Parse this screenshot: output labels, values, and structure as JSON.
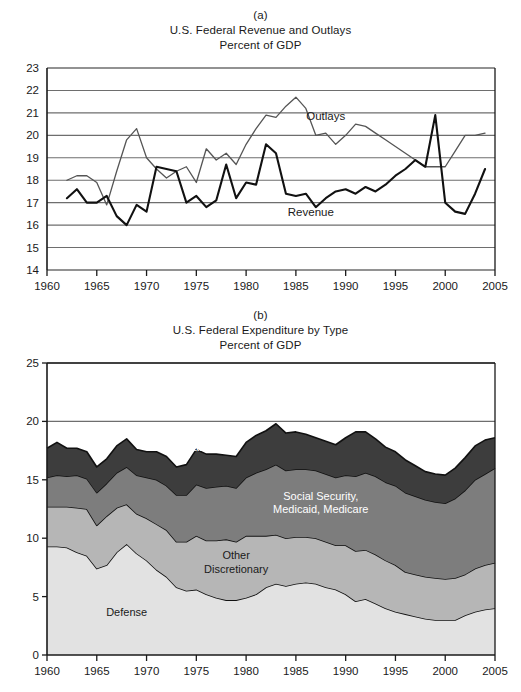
{
  "figure": {
    "panels": [
      {
        "letter": "(a)",
        "title": "U.S. Federal Revenue and Outlays",
        "subtitle": "Percent of GDP"
      },
      {
        "letter": "(b)",
        "title": "U.S. Federal Expenditure by Type",
        "subtitle": "Percent of GDP"
      }
    ]
  },
  "chart_data": [
    {
      "type": "line",
      "title": "U.S. Federal Revenue and Outlays",
      "subtitle": "Percent of GDP",
      "panel": "(a)",
      "xlabel": "",
      "ylabel": "Percent of GDP",
      "xlim": [
        1960,
        2005
      ],
      "ylim": [
        14,
        23
      ],
      "xticks": [
        1960,
        1965,
        1970,
        1975,
        1980,
        1985,
        1990,
        1995,
        2000,
        2005
      ],
      "yticks": [
        14,
        15,
        16,
        17,
        18,
        19,
        20,
        21,
        22,
        23
      ],
      "grid": "horizontal",
      "legend": "inline-annotations",
      "annotations": [
        {
          "text": "Outlays",
          "x": 1988.0,
          "y": 20.85
        },
        {
          "text": "Revenue",
          "x": 1986.5,
          "y": 16.6
        }
      ],
      "x": [
        1962,
        1963,
        1964,
        1965,
        1966,
        1967,
        1968,
        1969,
        1970,
        1971,
        1972,
        1973,
        1974,
        1975,
        1976,
        1977,
        1978,
        1979,
        1980,
        1981,
        1982,
        1983,
        1984,
        1985,
        1986,
        1987,
        1988,
        1989,
        1990,
        1991,
        1992,
        1993,
        1994,
        1995,
        1996,
        1997,
        1998,
        1999,
        2000,
        2001,
        2002,
        2003,
        2004
      ],
      "series": [
        {
          "name": "Revenue",
          "style": "thick-black",
          "values": [
            17.2,
            17.6,
            17.0,
            17.0,
            17.3,
            16.4,
            16.0,
            16.9,
            16.6,
            18.6,
            18.5,
            18.4,
            17.0,
            17.3,
            16.8,
            17.1,
            18.7,
            17.2,
            17.9,
            17.8,
            19.6,
            19.2,
            17.4,
            17.3,
            17.4,
            16.8,
            17.2,
            17.5,
            17.6,
            17.4,
            17.7,
            17.5,
            17.8,
            18.2,
            18.5,
            18.9,
            18.6,
            20.9,
            17.0,
            16.6,
            16.5,
            17.4,
            18.5
          ]
        },
        {
          "name": "Outlays",
          "style": "thin-gray",
          "values": [
            18.0,
            18.2,
            18.2,
            17.9,
            16.9,
            18.4,
            19.8,
            20.3,
            19.0,
            18.5,
            18.1,
            18.4,
            18.6,
            17.9,
            19.4,
            18.9,
            19.2,
            18.7,
            19.6,
            20.3,
            20.9,
            20.8,
            21.3,
            21.7,
            21.2,
            20.0,
            20.1,
            19.6,
            20.0,
            20.5,
            20.4,
            20.1,
            19.8,
            19.5,
            19.2,
            18.9,
            18.6,
            18.6,
            18.6,
            19.3,
            20.0,
            20.0,
            20.1,
            20.4
          ]
        }
      ]
    },
    {
      "type": "area",
      "stacked": true,
      "title": "U.S. Federal Expenditure by Type",
      "subtitle": "Percent of GDP",
      "panel": "(b)",
      "xlabel": "",
      "ylabel": "Percent of GDP",
      "xlim": [
        1960,
        2005
      ],
      "ylim": [
        0,
        25
      ],
      "xticks": [
        1960,
        1965,
        1970,
        1975,
        1980,
        1985,
        1990,
        1995,
        2000,
        2005
      ],
      "yticks": [
        0,
        5,
        10,
        15,
        20,
        25
      ],
      "grid": "horizontal",
      "legend": "inline-area-labels",
      "annotations": [
        {
          "text": "Other Mandatory",
          "x": 1974.5,
          "y": 18.6,
          "color": "#ffffff"
        },
        {
          "text": "Social Security, Medicaid, Medicare",
          "x": 1987.5,
          "y": 13.3,
          "color": "#ffffff"
        },
        {
          "text": "Other Discretionary",
          "x": 1979.0,
          "y": 8.2,
          "color": "#1a1a1a"
        },
        {
          "text": "Defense",
          "x": 1968.0,
          "y": 3.3,
          "color": "#1a1a1a"
        }
      ],
      "x": [
        1960,
        1961,
        1962,
        1963,
        1964,
        1965,
        1966,
        1967,
        1968,
        1969,
        1970,
        1971,
        1972,
        1973,
        1974,
        1975,
        1976,
        1977,
        1978,
        1979,
        1980,
        1981,
        1982,
        1983,
        1984,
        1985,
        1986,
        1987,
        1988,
        1989,
        1990,
        1991,
        1992,
        1993,
        1994,
        1995,
        1996,
        1997,
        1998,
        1999,
        2000,
        2001,
        2002,
        2003,
        2004,
        2005
      ],
      "series": [
        {
          "name": "Defense",
          "color": "#e2e2e2",
          "values": [
            9.3,
            9.3,
            9.2,
            8.8,
            8.5,
            7.4,
            7.7,
            8.8,
            9.5,
            8.7,
            8.1,
            7.3,
            6.7,
            5.8,
            5.5,
            5.6,
            5.2,
            4.9,
            4.7,
            4.7,
            4.9,
            5.2,
            5.8,
            6.1,
            5.9,
            6.1,
            6.2,
            6.1,
            5.8,
            5.6,
            5.2,
            4.6,
            4.8,
            4.4,
            4.0,
            3.7,
            3.5,
            3.3,
            3.1,
            3.0,
            3.0,
            3.0,
            3.4,
            3.7,
            3.9,
            4.0
          ]
        },
        {
          "name": "Other Discretionary",
          "color": "#b6b6b6",
          "values": [
            3.4,
            3.4,
            3.5,
            3.8,
            4.0,
            3.7,
            4.2,
            3.8,
            3.4,
            3.4,
            3.6,
            3.9,
            4.0,
            3.9,
            4.2,
            4.6,
            4.6,
            4.9,
            5.2,
            5.0,
            5.3,
            5.0,
            4.4,
            4.2,
            4.1,
            4.0,
            3.9,
            3.9,
            3.9,
            3.8,
            4.2,
            4.3,
            4.2,
            4.2,
            4.1,
            4.0,
            3.6,
            3.6,
            3.6,
            3.6,
            3.5,
            3.6,
            3.5,
            3.7,
            3.8,
            3.9
          ]
        },
        {
          "name": "Social Security, Medicaid, Medicare",
          "color": "#7d7d7d",
          "values": [
            2.5,
            2.7,
            2.6,
            2.8,
            2.6,
            2.8,
            2.8,
            3.0,
            3.2,
            3.3,
            3.5,
            3.8,
            3.8,
            4.0,
            4.0,
            4.4,
            4.5,
            4.6,
            4.6,
            4.6,
            5.0,
            5.4,
            5.7,
            6.0,
            5.8,
            5.8,
            5.8,
            5.8,
            5.8,
            5.8,
            6.0,
            6.4,
            6.6,
            6.7,
            6.7,
            6.8,
            6.8,
            6.7,
            6.6,
            6.5,
            6.5,
            6.8,
            7.2,
            7.6,
            7.8,
            8.1
          ]
        },
        {
          "name": "Other Mandatory",
          "color": "#3d3d3d",
          "values": [
            2.5,
            2.8,
            2.4,
            2.3,
            2.3,
            2.2,
            2.1,
            2.3,
            2.4,
            2.2,
            2.2,
            2.4,
            2.5,
            2.4,
            2.6,
            3.0,
            2.9,
            2.8,
            2.6,
            2.7,
            3.0,
            3.2,
            3.3,
            3.5,
            3.2,
            3.2,
            3.0,
            2.8,
            2.8,
            2.8,
            3.2,
            3.8,
            3.5,
            3.2,
            3.0,
            2.9,
            2.8,
            2.6,
            2.4,
            2.4,
            2.4,
            2.6,
            2.8,
            2.9,
            2.9,
            2.6
          ]
        }
      ]
    }
  ],
  "axis_a": {
    "y_ticks": [
      "23",
      "22",
      "21",
      "20",
      "19",
      "18",
      "17",
      "16",
      "15",
      "14"
    ],
    "x_ticks": [
      "1960",
      "1965",
      "1970",
      "1975",
      "1980",
      "1985",
      "1990",
      "1995",
      "2000",
      "2005"
    ]
  },
  "axis_b": {
    "y_ticks": [
      "25",
      "20",
      "15",
      "10",
      "5",
      "0"
    ],
    "x_ticks": [
      "1960",
      "1965",
      "1970",
      "1975",
      "1980",
      "1985",
      "1990",
      "1995",
      "2000",
      "2005"
    ]
  },
  "labels_a": {
    "outlays": "Outlays",
    "revenue": "Revenue"
  },
  "labels_b": {
    "other_mandatory_1": "Other",
    "other_mandatory_2": "Mandatory",
    "ssmm_1": "Social Security,",
    "ssmm_2": "Medicaid, Medicare",
    "other_disc_1": "Other",
    "other_disc_2": "Discretionary",
    "defense": "Defense"
  },
  "colors": {
    "defense": "#e2e2e2",
    "other_discretionary": "#b6b6b6",
    "social_security": "#7d7d7d",
    "other_mandatory": "#3d3d3d",
    "axis": "#1a1a1a",
    "gridline": "#6e6e6e",
    "revenue_line": "#111111",
    "outlays_line": "#555555"
  }
}
